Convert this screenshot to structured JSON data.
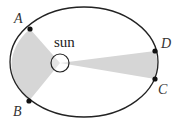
{
  "diagram": {
    "orbit": {
      "cx": 84,
      "cy": 62,
      "rx": 74,
      "ry": 55,
      "stroke": "#222222"
    },
    "sun": {
      "label": "sun",
      "cx": 60,
      "cy": 63,
      "r": 9
    },
    "points": [
      {
        "id": "A",
        "label": "A",
        "x": 30,
        "y": 29,
        "lx": 14,
        "ly": 23
      },
      {
        "id": "B",
        "label": "B",
        "x": 29,
        "y": 101,
        "lx": 13,
        "ly": 116
      },
      {
        "id": "C",
        "label": "C",
        "x": 155,
        "y": 79,
        "lx": 158,
        "ly": 94
      },
      {
        "id": "D",
        "label": "D",
        "x": 155,
        "y": 51,
        "lx": 161,
        "ly": 48
      }
    ],
    "sectors": [
      {
        "name": "sector-AB",
        "from": "A",
        "to": "B",
        "fill": "#d6d6d6"
      },
      {
        "name": "sector-CD",
        "from": "C",
        "to": "D",
        "fill": "#d6d6d6"
      }
    ]
  }
}
